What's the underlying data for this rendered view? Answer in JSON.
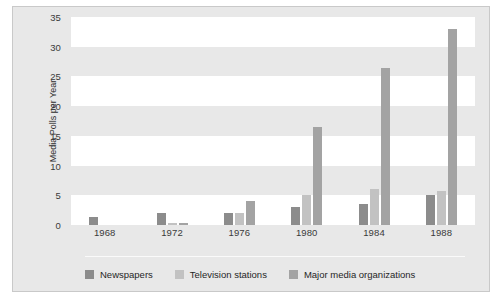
{
  "chart_data": {
    "type": "bar",
    "title": "",
    "subtitle": "",
    "xlabel": "",
    "ylabel": "Media Polls per Year",
    "categories": [
      "1968",
      "1972",
      "1976",
      "1980",
      "1984",
      "1988"
    ],
    "series": [
      {
        "name": "Newspapers",
        "color": "#8c8c8c",
        "values": [
          1.3,
          2.0,
          2.0,
          3.0,
          3.5,
          5.0
        ]
      },
      {
        "name": "Television stations",
        "color": "#c2c2c2",
        "values": [
          0,
          0.3,
          2.0,
          5.0,
          6.0,
          5.8
        ]
      },
      {
        "name": "Major media organizations",
        "color": "#a3a3a3",
        "values": [
          0,
          0.4,
          4.0,
          16.5,
          26.5,
          33.0
        ]
      }
    ],
    "ylim": [
      0,
      35
    ],
    "yticks": [
      0,
      5,
      10,
      15,
      20,
      25,
      30,
      35
    ],
    "ytick_labels": [
      "0",
      "5",
      "10",
      "15",
      "20",
      "25",
      "30",
      "35"
    ],
    "grid": "horizontal-bands",
    "legend_position": "bottom-left",
    "plot_background": "#e8e8e8",
    "band_color": "#ffffff",
    "figure_border": "#c9c9c9"
  },
  "legend": {
    "items": [
      {
        "label": "Newspapers"
      },
      {
        "label": "Television stations"
      },
      {
        "label": "Major media organizations"
      }
    ]
  }
}
